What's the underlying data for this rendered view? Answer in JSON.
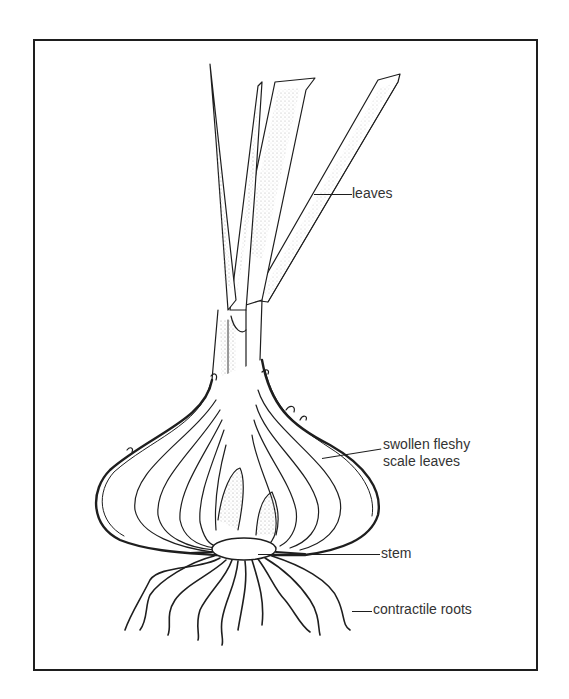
{
  "diagram": {
    "labels": {
      "leaves": "leaves",
      "scale_leaves_line1": "swollen fleshy",
      "scale_leaves_line2": "scale leaves",
      "stem": "stem",
      "roots": "contractile roots"
    },
    "colors": {
      "ink": "#1e1e1e",
      "label_text": "#333333",
      "background": "#ffffff",
      "stipple": "#9a9a9a"
    }
  }
}
